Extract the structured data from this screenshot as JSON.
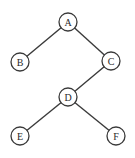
{
  "diagram": {
    "type": "binary-tree",
    "nodes": [
      {
        "id": "A",
        "label": "A",
        "cx": 68,
        "cy": 22
      },
      {
        "id": "B",
        "label": "B",
        "cx": 20,
        "cy": 62
      },
      {
        "id": "C",
        "label": "C",
        "cx": 111,
        "cy": 61
      },
      {
        "id": "D",
        "label": "D",
        "cx": 68,
        "cy": 97
      },
      {
        "id": "E",
        "label": "E",
        "cx": 20,
        "cy": 136
      },
      {
        "id": "F",
        "label": "F",
        "cx": 116,
        "cy": 136
      }
    ],
    "edges": [
      {
        "from": "A",
        "to": "B"
      },
      {
        "from": "A",
        "to": "C"
      },
      {
        "from": "C",
        "to": "D"
      },
      {
        "from": "D",
        "to": "E"
      },
      {
        "from": "D",
        "to": "F"
      }
    ],
    "node_radius": 9,
    "colors": {
      "stroke": "#3a3a3a",
      "fill": "#ffffff",
      "text": "#2a2a2a"
    }
  }
}
